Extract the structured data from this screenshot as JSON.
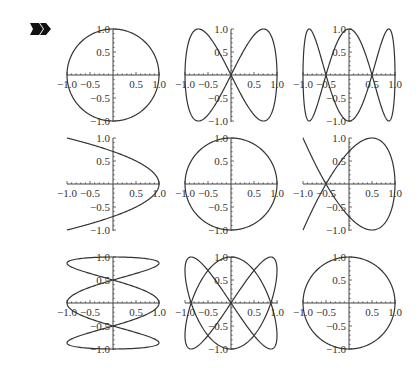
{
  "marker": {
    "icon": "output-arrow-icon"
  },
  "axes": {
    "x_ticks": [
      "−1.0",
      "−0.5",
      "0.5",
      "1.0"
    ],
    "y_ticks": [
      "1.0",
      "0.5",
      "−0.5",
      "−1.0"
    ]
  },
  "chart_data": [
    {
      "type": "line",
      "row": 0,
      "col": 0,
      "x": "cos(t)",
      "y": "sin(t)",
      "t_range": [
        0,
        6.2832
      ],
      "xlim": [
        -1,
        1
      ],
      "ylim": [
        -1,
        1
      ]
    },
    {
      "type": "line",
      "row": 0,
      "col": 1,
      "x": "sin(t)",
      "y": "sin(2t)",
      "t_range": [
        0,
        6.2832
      ],
      "xlim": [
        -1,
        1
      ],
      "ylim": [
        -1,
        1
      ]
    },
    {
      "type": "line",
      "row": 0,
      "col": 2,
      "x": "sin(t)",
      "y": "cos(3t)",
      "t_range": [
        0,
        6.2832
      ],
      "xlim": [
        -1,
        1
      ],
      "ylim": [
        -1,
        1
      ]
    },
    {
      "type": "line",
      "row": 1,
      "col": 0,
      "x": "cos(2t)",
      "y": "sin(t)",
      "t_range": [
        -1.5708,
        1.5708
      ],
      "xlim": [
        -1,
        1
      ],
      "ylim": [
        -1,
        1
      ]
    },
    {
      "type": "line",
      "row": 1,
      "col": 1,
      "x": "cos(2t)",
      "y": "sin(2t)",
      "t_range": [
        0,
        3.1416
      ],
      "xlim": [
        -1,
        1
      ],
      "ylim": [
        -1,
        1
      ]
    },
    {
      "type": "line",
      "row": 1,
      "col": 2,
      "x": "cos(2t)",
      "y": "sin(3t)",
      "t_range": [
        -1.5708,
        1.5708
      ],
      "xlim": [
        -1,
        1
      ],
      "ylim": [
        -1,
        1
      ]
    },
    {
      "type": "line",
      "row": 2,
      "col": 0,
      "x": "cos(3t)",
      "y": "sin(t)",
      "t_range": [
        0,
        6.2832
      ],
      "xlim": [
        -1,
        1
      ],
      "ylim": [
        -1,
        1
      ]
    },
    {
      "type": "line",
      "row": 2,
      "col": 1,
      "x": "sin(2t)",
      "y": "sin(3t)",
      "t_range": [
        0,
        6.2832
      ],
      "xlim": [
        -1,
        1
      ],
      "ylim": [
        -1,
        1
      ]
    },
    {
      "type": "line",
      "row": 2,
      "col": 2,
      "x": "cos(3t)",
      "y": "sin(3t)",
      "t_range": [
        0,
        2.0944
      ],
      "xlim": [
        -1,
        1
      ],
      "ylim": [
        -1,
        1
      ]
    }
  ]
}
